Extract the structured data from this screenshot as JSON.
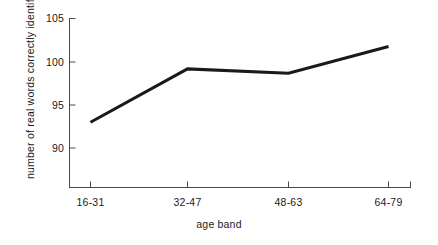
{
  "chart_data": {
    "type": "line",
    "title": "",
    "subtitle": "",
    "xlabel": "age band",
    "ylabel": "number of real words correctly identified",
    "categories": [
      "16-31",
      "32-47",
      "48-63",
      "64-79"
    ],
    "values": [
      93.0,
      99.2,
      98.7,
      101.8
    ],
    "series": [
      {
        "name": "number of real words correctly identified",
        "values": [
          93.0,
          99.2,
          98.7,
          101.8
        ]
      }
    ],
    "yticks": [
      90,
      95,
      100,
      105
    ],
    "ytick_labels": [
      "90",
      "95",
      "100",
      "105"
    ],
    "ylim": [
      87.0,
      105.0
    ],
    "xtick_labels": [
      "16-31",
      "32-47",
      "48-63",
      "64-79"
    ],
    "grid": false,
    "legend": false,
    "legend_position": "none",
    "line_color": "#1a1a1a",
    "line_width": 3,
    "axis_color": "#3a3a3a",
    "background_color": "#ffffff",
    "annotations": []
  }
}
